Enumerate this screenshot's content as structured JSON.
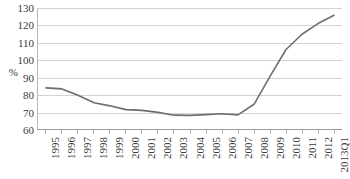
{
  "chart_data": {
    "type": "line",
    "title": "",
    "subtitle": "",
    "xlabel": "",
    "ylabel": "%",
    "ylim": [
      60,
      130
    ],
    "ytick_step": 10,
    "yticks": [
      130,
      120,
      110,
      100,
      90,
      80,
      70,
      60
    ],
    "grid": true,
    "legend": false,
    "legend_position": "none",
    "categories": [
      "1995",
      "1996",
      "1997",
      "1998",
      "1999",
      "2000",
      "2001",
      "2002",
      "2003",
      "2004",
      "2005",
      "2006",
      "2007",
      "2008",
      "2009",
      "2010",
      "2011",
      "2012",
      "2013Q1"
    ],
    "series": [
      {
        "name": "",
        "color": "#6e6e6e",
        "values": [
          83.8,
          83.2,
          79.5,
          75.2,
          73.4,
          71.2,
          70.8,
          69.6,
          68.0,
          67.9,
          68.3,
          68.8,
          68.2,
          74.3,
          90.5,
          106.0,
          114.8,
          121.0,
          125.8
        ]
      }
    ]
  },
  "axis": {
    "y_unit_label": "%"
  }
}
